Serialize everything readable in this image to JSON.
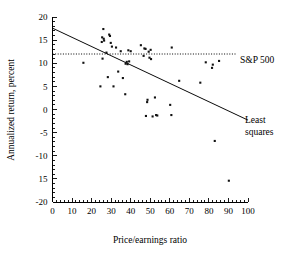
{
  "chart_data": {
    "type": "scatter",
    "title": "",
    "xlabel": "Price/earnings ratio",
    "ylabel": "Annualized return, percent",
    "xlim": [
      0,
      100
    ],
    "ylim": [
      -20,
      20
    ],
    "grid": false,
    "legend": "none",
    "xticks": [
      0,
      10,
      20,
      30,
      40,
      50,
      60,
      70,
      80,
      90,
      100
    ],
    "xtick_labels": [
      "0",
      "10",
      "20",
      "30",
      "40",
      "50",
      "60",
      "70",
      "80",
      "90",
      "100"
    ],
    "yticks": [
      20,
      15,
      10,
      5,
      0,
      -5,
      -10,
      -15,
      -20
    ],
    "ytick_labels": [
      "20",
      "15",
      "10",
      "5",
      "0",
      "-5",
      "-10",
      "15",
      "-20"
    ],
    "series": [
      {
        "name": "Mutual funds",
        "marker": "filled-square",
        "color": "#111111",
        "points": [
          [
            15.8,
            10.1
          ],
          [
            24.5,
            5.0
          ],
          [
            25.2,
            14.6
          ],
          [
            25.4,
            15.6
          ],
          [
            25.6,
            11.0
          ],
          [
            26.0,
            17.4
          ],
          [
            26.2,
            15.3
          ],
          [
            26.4,
            14.9
          ],
          [
            27.6,
            12.3
          ],
          [
            28.3,
            7.0
          ],
          [
            29.0,
            16.2
          ],
          [
            29.4,
            15.9
          ],
          [
            29.8,
            14.4
          ],
          [
            30.4,
            13.6
          ],
          [
            31.2,
            5.0
          ],
          [
            32.5,
            13.4
          ],
          [
            33.6,
            8.2
          ],
          [
            34.9,
            12.6
          ],
          [
            36.0,
            6.8
          ],
          [
            37.2,
            3.3
          ],
          [
            37.4,
            9.9
          ],
          [
            38.0,
            10.3
          ],
          [
            38.4,
            9.8
          ],
          [
            38.8,
            12.8
          ],
          [
            39.2,
            10.4
          ],
          [
            40.0,
            12.6
          ],
          [
            45.2,
            13.9
          ],
          [
            46.6,
            11.6
          ],
          [
            47.0,
            13.2
          ],
          [
            47.6,
            13.1
          ],
          [
            47.8,
            -1.4
          ],
          [
            48.4,
            1.6
          ],
          [
            48.6,
            2.1
          ],
          [
            49.2,
            12.5
          ],
          [
            49.6,
            11.2
          ],
          [
            50.2,
            12.9
          ],
          [
            50.4,
            10.9
          ],
          [
            51.2,
            -1.5
          ],
          [
            52.4,
            2.6
          ],
          [
            53.0,
            -1.2
          ],
          [
            53.6,
            -1.3
          ],
          [
            60.2,
            1.0
          ],
          [
            60.8,
            -1.2
          ],
          [
            61.0,
            13.4
          ],
          [
            64.8,
            6.2
          ],
          [
            75.6,
            5.8
          ],
          [
            78.4,
            10.2
          ],
          [
            81.6,
            9.0
          ],
          [
            82.0,
            9.7
          ],
          [
            83.0,
            -6.8
          ],
          [
            85.2,
            10.5
          ],
          [
            90.2,
            -15.4
          ]
        ]
      }
    ],
    "reference_lines": [
      {
        "name": "sp500",
        "label": "S&P 500",
        "orientation": "horizontal",
        "value": 12.0,
        "style": "dotted"
      }
    ],
    "fit_lines": [
      {
        "name": "least-squares",
        "label_line1": "Least",
        "label_line2": "squares",
        "style": "solid",
        "x_start": 0,
        "y_start": 17.6,
        "x_end": 100,
        "y_end": -2.3
      }
    ]
  }
}
